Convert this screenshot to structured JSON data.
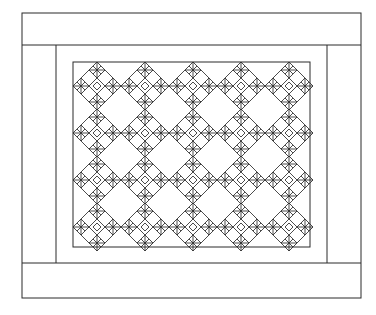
{
  "figure": {
    "ink_color": "#2a2a2a",
    "background": "#ffffff",
    "frame": {
      "outer": {
        "x1": 22,
        "y1": 13,
        "x2": 361,
        "y2": 298
      },
      "top_band_bottom": 45,
      "bottom_band_top": 263,
      "left_border_inner_x": 56,
      "right_border_inner_x": 327,
      "sashing": {
        "x1": 56,
        "y1": 45,
        "x2": 327,
        "y2": 263
      },
      "field": {
        "x1": 73,
        "y1": 62,
        "x2": 310,
        "y2": 247
      }
    },
    "blocks": {
      "columns": 5,
      "rows": 4,
      "center_x": [
        97,
        145,
        193,
        241,
        289
      ],
      "center_y": [
        86,
        133,
        180,
        227
      ],
      "half_size": 24,
      "orientation": "on-point"
    }
  }
}
